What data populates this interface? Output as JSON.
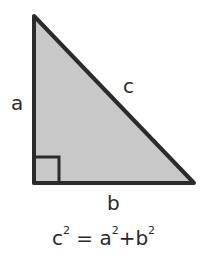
{
  "diagram": {
    "fill_color": "#c8c8c8",
    "stroke_color": "#2b2b2b",
    "vertices": {
      "top": [
        34,
        16
      ],
      "bottom_left": [
        34,
        183
      ],
      "bottom_right": [
        194,
        183
      ]
    },
    "labels": {
      "side_a": "a",
      "side_b": "b",
      "side_c": "c"
    },
    "formula": {
      "lhs_base": "c",
      "lhs_exp": "2",
      "eq": "=",
      "term1_base": "a",
      "term1_exp": "2",
      "plus": "+",
      "term2_base": "b",
      "term2_exp": "2"
    }
  }
}
